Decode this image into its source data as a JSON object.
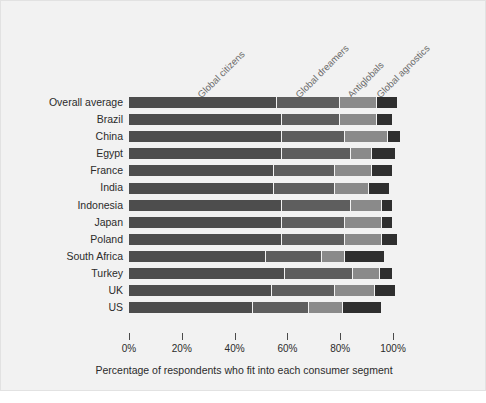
{
  "chart_data": {
    "type": "bar",
    "orientation": "horizontal",
    "stacked": true,
    "title": "",
    "xlabel": "Percentage of respondents who fit into each consumer segment",
    "ylabel": "",
    "xlim": [
      0,
      100
    ],
    "xticks": [
      0,
      20,
      40,
      60,
      80,
      100
    ],
    "xticklabels": [
      "0%",
      "20%",
      "40%",
      "60%",
      "80%",
      "100%"
    ],
    "grid": false,
    "legend_position": "top-rotated-annotations",
    "categories": [
      "Overall average",
      "Brazil",
      "China",
      "Egypt",
      "France",
      "India",
      "Indonesia",
      "Japan",
      "Poland",
      "South Africa",
      "Turkey",
      "UK",
      "US"
    ],
    "series": [
      {
        "name": "Global citizens",
        "color": "#4d4d4d",
        "values": [
          56,
          58,
          58,
          58,
          55,
          55,
          58,
          58,
          58,
          52,
          59,
          54,
          47
        ]
      },
      {
        "name": "Global dreamers",
        "color": "#5e5e5e",
        "values": [
          24,
          22,
          24,
          26,
          23,
          23,
          26,
          24,
          24,
          21,
          26,
          24,
          21
        ]
      },
      {
        "name": "Antiglobals",
        "color": "#8a8a8a",
        "values": [
          14,
          14,
          16,
          8,
          14,
          13,
          12,
          14,
          14,
          9,
          10,
          15,
          13
        ]
      },
      {
        "name": "Global agnostics",
        "color": "#2f2f2f",
        "values": [
          8,
          6,
          5,
          9,
          8,
          8,
          4,
          4,
          6,
          15,
          5,
          8,
          15
        ]
      }
    ],
    "annotations": [
      {
        "text": "Global citizens",
        "rotation": -45
      },
      {
        "text": "Global dreamers",
        "rotation": -45
      },
      {
        "text": "Antiglobals",
        "rotation": -45
      },
      {
        "text": "Global agnostics",
        "rotation": -45
      }
    ],
    "background_color": "#f2f2f2",
    "text_color": "#2b2b2b",
    "annotation_color": "#6b6b6b"
  }
}
